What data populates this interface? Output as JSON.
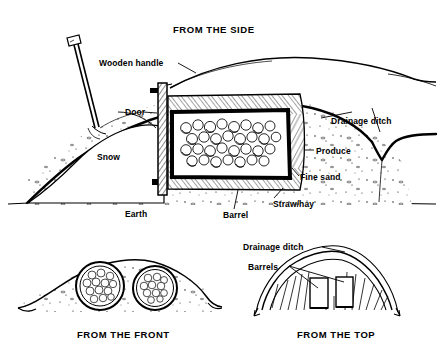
{
  "figure": {
    "ink_color": "#000000",
    "paper_color": "#ffffff"
  },
  "panels": {
    "side": {
      "caption": "FROM THE SIDE",
      "labels": {
        "wooden_handle": "Wooden handle",
        "door": "Door",
        "snow": "Snow",
        "earth": "Earth",
        "barrel": "Barrel",
        "straw_hay": "Straw/hay",
        "fine_sand": "Fine sand",
        "produce": "Produce",
        "drainage_ditch": "Drainage ditch"
      }
    },
    "front": {
      "caption": "FROM THE FRONT"
    },
    "top": {
      "caption": "FROM THE TOP",
      "labels": {
        "drainage_ditch": "Drainage ditch",
        "barrels": "Barrels"
      }
    }
  }
}
